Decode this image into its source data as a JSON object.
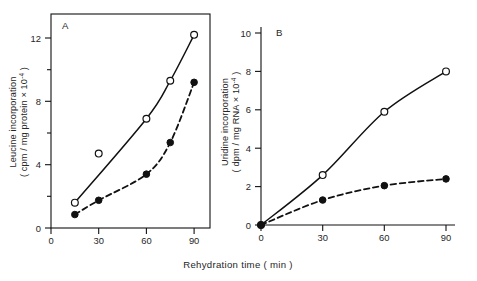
{
  "figure": {
    "xaxis_caption": "Rehydration time ( min )",
    "background_color": "#ffffff",
    "line_color": "#111111",
    "marker_open_fill": "#ffffff",
    "marker_closed_fill": "#111111"
  },
  "panels": {
    "a": {
      "letter": "A",
      "ylabel_line1": "Leucine  incorporation",
      "ylabel_line2_pre": "( cpm / mg  protein  × 10",
      "ylabel_line2_sup": "-4",
      "ylabel_line2_post": " )",
      "ytick_labels": [
        "0",
        "4",
        "8",
        "12"
      ],
      "xtick_labels": [
        "0",
        "30",
        "60",
        "90"
      ]
    },
    "b": {
      "letter": "B",
      "ylabel_line1": "Uridine  incorporation",
      "ylabel_line2_pre": "( dpm / mg   RNA × 10",
      "ylabel_line2_sup": "-4",
      "ylabel_line2_post": " )",
      "ytick_labels": [
        "0",
        "2",
        "4",
        "6",
        "8",
        "10"
      ],
      "xtick_labels": [
        "0",
        "30",
        "60",
        "90"
      ]
    }
  },
  "chart_data": [
    {
      "type": "line",
      "panel": "A",
      "title": "A",
      "xlabel": "Rehydration time ( min )",
      "ylabel": "Leucine incorporation ( cpm / mg protein × 10^-4 )",
      "xlim": [
        0,
        100
      ],
      "ylim": [
        0,
        13
      ],
      "xticks": [
        0,
        30,
        60,
        90
      ],
      "yticks": [
        0,
        2,
        4,
        6,
        8,
        10,
        12
      ],
      "ytick_labeled": [
        0,
        4,
        8,
        12
      ],
      "grid": false,
      "frame": "box",
      "legend": "none",
      "series": [
        {
          "name": "open-circle",
          "marker": "open circle",
          "linestyle": "solid",
          "x": [
            15,
            30,
            60,
            75,
            90
          ],
          "y": [
            1.6,
            4.7,
            6.9,
            9.3,
            12.2
          ],
          "note": "point at x=30 (y=4.7) plotted off the fitted curve"
        },
        {
          "name": "filled-circle",
          "marker": "filled circle",
          "linestyle": "dashed",
          "x": [
            15,
            30,
            60,
            75,
            90
          ],
          "y": [
            0.85,
            1.75,
            3.4,
            5.4,
            9.2
          ]
        }
      ]
    },
    {
      "type": "line",
      "panel": "B",
      "title": "B",
      "xlabel": "Rehydration time ( min )",
      "ylabel": "Uridine incorporation ( dpm / mg RNA × 10^-4 )",
      "xlim": [
        0,
        100
      ],
      "ylim": [
        0,
        10.4
      ],
      "xticks": [
        0,
        30,
        60,
        90
      ],
      "yticks": [
        0,
        2,
        4,
        6,
        8,
        10
      ],
      "ytick_labeled": [
        0,
        2,
        4,
        6,
        8,
        10
      ],
      "grid": false,
      "frame": "left-bottom",
      "legend": "none",
      "series": [
        {
          "name": "open-circle",
          "marker": "open circle",
          "linestyle": "solid",
          "x": [
            0,
            30,
            60,
            90
          ],
          "y": [
            0,
            2.6,
            5.9,
            8.0
          ]
        },
        {
          "name": "filled-circle",
          "marker": "filled circle",
          "linestyle": "dashed",
          "x": [
            0,
            30,
            60,
            90
          ],
          "y": [
            0,
            1.3,
            2.05,
            2.4
          ]
        }
      ]
    }
  ]
}
